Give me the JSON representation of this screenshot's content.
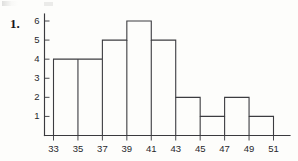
{
  "problem_label": "1.",
  "chart_data": {
    "type": "bar",
    "title": "",
    "subtitle": "",
    "xlabel": "",
    "ylabel": "",
    "bin_edges": [
      33,
      35,
      37,
      39,
      41,
      43,
      45,
      47,
      49,
      51
    ],
    "bin_width": 2,
    "categories": [
      "33-35",
      "35-37",
      "37-39",
      "39-41",
      "41-43",
      "43-45",
      "45-47",
      "47-49",
      "49-51"
    ],
    "values": [
      4,
      4,
      5,
      6,
      5,
      2,
      1,
      2,
      1
    ],
    "x_tick_labels": [
      "33",
      "35",
      "37",
      "39",
      "41",
      "43",
      "45",
      "47",
      "49",
      "51"
    ],
    "y_tick_labels": [
      "1",
      "2",
      "3",
      "4",
      "5",
      "6"
    ],
    "y_tick_values": [
      1,
      2,
      3,
      4,
      5,
      6
    ],
    "xlim": [
      33,
      51
    ],
    "ylim": [
      0,
      6
    ],
    "grid": false,
    "legend": false,
    "legend_position": "none",
    "bar_fill": "#ffffff",
    "bar_stroke": "#3c3c40",
    "axis_color": "#3a3a3e",
    "background": "#fdfdfb"
  }
}
